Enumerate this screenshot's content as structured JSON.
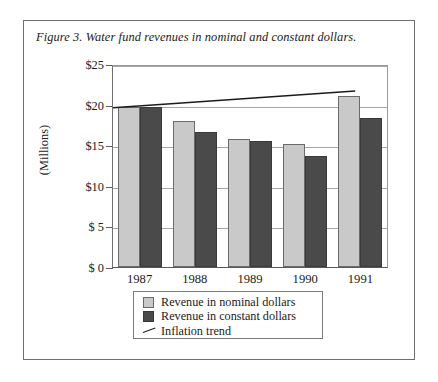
{
  "figure": {
    "title": "Figure 3. Water fund revenues in nominal and constant dollars."
  },
  "chart_data": {
    "type": "bar",
    "title": "Figure 3. Water fund revenues in nominal and constant dollars.",
    "xlabel": "",
    "ylabel": "(Millions)",
    "ylim": [
      0,
      25
    ],
    "grid": true,
    "legend_position": "bottom",
    "categories": [
      "1987",
      "1988",
      "1989",
      "1990",
      "1991"
    ],
    "ytick_labels": [
      "$25",
      "$20",
      "$15",
      "$10",
      "$ 5",
      "$ 0"
    ],
    "ytick_values": [
      25,
      20,
      15,
      10,
      5,
      0
    ],
    "series": [
      {
        "name": "Revenue in nominal dollars",
        "type": "bar",
        "color": "#c9c9c9",
        "values": [
          19.7,
          18.0,
          15.8,
          15.1,
          21.1
        ]
      },
      {
        "name": "Revenue in constant dollars",
        "type": "bar",
        "color": "#4a4a4a",
        "values": [
          19.7,
          16.6,
          15.5,
          13.7,
          18.3
        ]
      },
      {
        "name": "Inflation trend",
        "type": "line",
        "color": "#1b1b1b",
        "x": [
          "1987",
          "1991"
        ],
        "values": [
          19.8,
          21.9
        ]
      }
    ]
  },
  "legend": {
    "items": [
      {
        "label": "Revenue in nominal dollars",
        "marker": "light-swatch"
      },
      {
        "label": "Revenue in constant dollars",
        "marker": "dark-swatch"
      },
      {
        "label": "Inflation trend",
        "marker": "line-segment"
      }
    ]
  }
}
